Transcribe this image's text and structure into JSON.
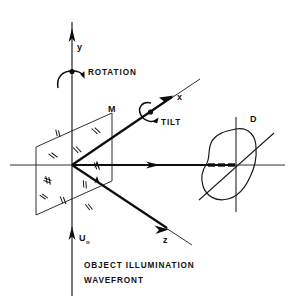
{
  "figure": {
    "background_color": "#ffffff",
    "ink_color": "#111111",
    "caption": {
      "line1": "OBJECT  ILLUMINATION",
      "line2": "WAVEFRONT"
    },
    "axes": [
      {
        "id": "y",
        "label": "y",
        "direction": "up",
        "description": "vertical axis pointing up with arrowhead"
      },
      {
        "id": "x",
        "label": "x",
        "direction": "up-right",
        "description": "axis into upper right with arrowhead"
      },
      {
        "id": "z",
        "label": "z",
        "direction": "down-right",
        "description": "axis into lower right with arrowhead"
      },
      {
        "id": "optical",
        "label": "",
        "direction": "right",
        "description": "horizontal optical axis toward object"
      }
    ],
    "annotations": [
      {
        "id": "rotation",
        "label": "ROTATION",
        "about_axis": "y",
        "description": "curved arrow about the vertical y axis"
      },
      {
        "id": "tilt",
        "label": "TILT",
        "about_axis": "x",
        "description": "curved arrow about the x axis"
      }
    ],
    "components": [
      {
        "id": "mask",
        "label": "M",
        "description": "tilted diffuser plane with random speckle hatch marks"
      },
      {
        "id": "object",
        "label": "D",
        "description": "irregular blob object with local axes and dashed chord"
      },
      {
        "id": "wavefront",
        "label": "U",
        "subscript": "o",
        "description": "object illumination wavefront arrow along vertical axis"
      }
    ]
  }
}
